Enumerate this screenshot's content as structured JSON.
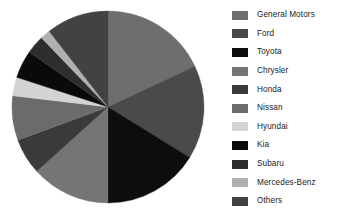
{
  "chart_data": {
    "type": "pie",
    "title": "",
    "subtitle": "",
    "xlabel": "",
    "ylabel": "",
    "legend_position": "right",
    "grid": false,
    "start_angle_deg": 0,
    "direction": "clockwise",
    "categories": [
      "General Motors",
      "Ford",
      "Toyota",
      "Chrysler",
      "Honda",
      "Nissan",
      "Hyundai",
      "Kia",
      "Subaru",
      "Mercedes-Benz",
      "Others"
    ],
    "values": [
      18.0,
      15.8,
      16.1,
      13.3,
      6.1,
      7.5,
      3.1,
      4.7,
      3.1,
      1.7,
      10.6
    ],
    "colors": [
      "#6e6e6e",
      "#4a4a4a",
      "#0d0d0d",
      "#757575",
      "#3a3a3a",
      "#6b6b6b",
      "#d4d4d4",
      "#0a0a0a",
      "#2e2e2e",
      "#b0b0b0",
      "#424242"
    ],
    "slices": [
      {
        "label": "General Motors",
        "value": 18.0,
        "color": "#6e6e6e",
        "start_deg": 0.0,
        "end_deg": 64.8
      },
      {
        "label": "Ford",
        "value": 15.8,
        "color": "#4a4a4a",
        "start_deg": 64.8,
        "end_deg": 121.7
      },
      {
        "label": "Toyota",
        "value": 16.1,
        "color": "#0d0d0d",
        "start_deg": 121.7,
        "end_deg": 180.0
      },
      {
        "label": "Chrysler",
        "value": 13.3,
        "color": "#757575",
        "start_deg": 180.0,
        "end_deg": 227.9
      },
      {
        "label": "Honda",
        "value": 6.1,
        "color": "#3a3a3a",
        "start_deg": 227.9,
        "end_deg": 249.8
      },
      {
        "label": "Nissan",
        "value": 7.5,
        "color": "#6b6b6b",
        "start_deg": 249.8,
        "end_deg": 276.8
      },
      {
        "label": "Hyundai",
        "value": 3.1,
        "color": "#d4d4d4",
        "start_deg": 276.8,
        "end_deg": 288.0
      },
      {
        "label": "Kia",
        "value": 4.7,
        "color": "#0a0a0a",
        "start_deg": 288.0,
        "end_deg": 304.9
      },
      {
        "label": "Subaru",
        "value": 3.1,
        "color": "#2e2e2e",
        "start_deg": 304.9,
        "end_deg": 316.1
      },
      {
        "label": "Mercedes-Benz",
        "value": 1.7,
        "color": "#b0b0b0",
        "start_deg": 316.1,
        "end_deg": 322.2
      },
      {
        "label": "Others",
        "value": 10.6,
        "color": "#424242",
        "start_deg": 322.2,
        "end_deg": 360.0
      }
    ]
  },
  "legend": {
    "items": [
      {
        "label": "General Motors",
        "color": "#6e6e6e"
      },
      {
        "label": "Ford",
        "color": "#4a4a4a"
      },
      {
        "label": "Toyota",
        "color": "#0d0d0d"
      },
      {
        "label": "Chrysler",
        "color": "#757575"
      },
      {
        "label": "Honda",
        "color": "#3a3a3a"
      },
      {
        "label": "Nissan",
        "color": "#6b6b6b"
      },
      {
        "label": "Hyundai",
        "color": "#d4d4d4"
      },
      {
        "label": "Kia",
        "color": "#0a0a0a"
      },
      {
        "label": "Subaru",
        "color": "#2e2e2e"
      },
      {
        "label": "Mercedes-Benz",
        "color": "#b0b0b0"
      },
      {
        "label": "Others",
        "color": "#424242"
      }
    ]
  },
  "canvas": {
    "background": "#ffffff",
    "pie_center_x": 97,
    "pie_center_y": 97,
    "pie_radius": 96
  }
}
